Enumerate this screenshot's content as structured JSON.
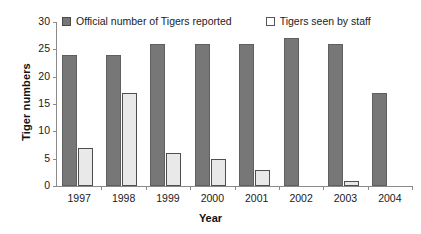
{
  "chart_data": {
    "type": "bar",
    "title": "",
    "xlabel": "Year",
    "ylabel": "Tiger numbers",
    "categories": [
      "1997",
      "1998",
      "1999",
      "2000",
      "2001",
      "2002",
      "2003",
      "2004"
    ],
    "series": [
      {
        "name": "Official number of Tigers reported",
        "color": "#777777",
        "values": [
          24,
          24,
          26,
          26,
          26,
          27,
          26,
          17
        ]
      },
      {
        "name": "Tigers seen by staff",
        "color": "#e9e9e9",
        "values": [
          7,
          17,
          6,
          5,
          3,
          0,
          1,
          0
        ]
      }
    ],
    "ylim": [
      0,
      30
    ],
    "yticks": [
      0,
      5,
      10,
      15,
      20,
      25,
      30
    ],
    "ytick_labels": [
      "0",
      "5",
      "10",
      "15",
      "20",
      "25",
      "30"
    ],
    "grid": false,
    "legend_position": "top"
  },
  "legend": {
    "entries": [
      {
        "label": "Official number of Tigers reported",
        "swatch": "dark-square-icon"
      },
      {
        "label": "Tigers seen by staff",
        "swatch": "light-square-icon"
      }
    ]
  }
}
